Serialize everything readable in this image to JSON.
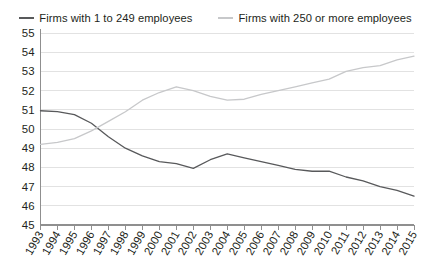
{
  "chart_data": {
    "type": "line",
    "title": "",
    "subtitle": "",
    "xlabel": "",
    "ylabel": "",
    "xlim": [
      1993,
      2015
    ],
    "ylim": [
      45,
      55
    ],
    "ytick_step": 1,
    "grid": "horizontal",
    "legend_position": "top-center",
    "x": [
      1993,
      1994,
      1995,
      1996,
      1997,
      1998,
      1999,
      2000,
      2001,
      2002,
      2003,
      2004,
      2005,
      2006,
      2007,
      2008,
      2009,
      2010,
      2011,
      2012,
      2013,
      2014,
      2015
    ],
    "xtick_labels": [
      "1993",
      "1994",
      "1995",
      "1996",
      "1997",
      "1998",
      "1999",
      "2000",
      "2001",
      "2002",
      "2003",
      "2004",
      "2005",
      "2006",
      "2007",
      "2008",
      "2009",
      "2010",
      "2011",
      "2012",
      "2013",
      "2014",
      "2015"
    ],
    "ytick_labels": [
      "45",
      "46",
      "47",
      "48",
      "49",
      "50",
      "51",
      "52",
      "53",
      "54",
      "55"
    ],
    "series": [
      {
        "name": "Firms with 1 to 249 employees",
        "color": "#58595b",
        "width": 1.3,
        "values": [
          50.95,
          50.9,
          50.75,
          50.3,
          49.6,
          49.0,
          48.6,
          48.3,
          48.2,
          47.95,
          48.4,
          48.7,
          48.5,
          48.3,
          48.1,
          47.9,
          47.8,
          47.8,
          47.5,
          47.3,
          47.0,
          46.8,
          46.5
        ]
      },
      {
        "name": "Firms with 250 or more employees",
        "color": "#c7c8ca",
        "width": 1.3,
        "values": [
          49.2,
          49.3,
          49.5,
          49.9,
          50.4,
          50.9,
          51.5,
          51.9,
          52.2,
          52.0,
          51.7,
          51.5,
          51.55,
          51.8,
          52.0,
          52.2,
          52.4,
          52.6,
          53.0,
          53.2,
          53.3,
          53.6,
          53.8
        ]
      }
    ]
  },
  "legend": {
    "items": [
      {
        "label": "Firms with 1 to 249 employees",
        "color": "#58595b"
      },
      {
        "label": "Firms with 250 or more employees",
        "color": "#c7c8ca"
      }
    ]
  }
}
